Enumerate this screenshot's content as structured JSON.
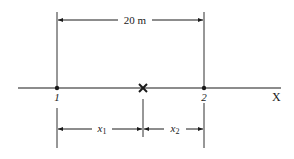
{
  "diagram": {
    "type": "one-dimensional position diagram",
    "axis_label": "X",
    "points": [
      {
        "id": "point-1",
        "label": "1",
        "marker": "dot"
      },
      {
        "id": "point-2",
        "label": "2",
        "marker": "dot"
      },
      {
        "id": "source",
        "label": "",
        "marker": "cross"
      }
    ],
    "dimensions": {
      "total": {
        "label": "20 m",
        "from": "1",
        "to": "2"
      },
      "x1": {
        "label_base": "x",
        "label_sub": "1",
        "from": "1",
        "to": "cross"
      },
      "x2": {
        "label_base": "x",
        "label_sub": "2",
        "from": "cross",
        "to": "2"
      }
    },
    "colors": {
      "ink": "#1a1a1a",
      "background": "#ffffff"
    }
  }
}
